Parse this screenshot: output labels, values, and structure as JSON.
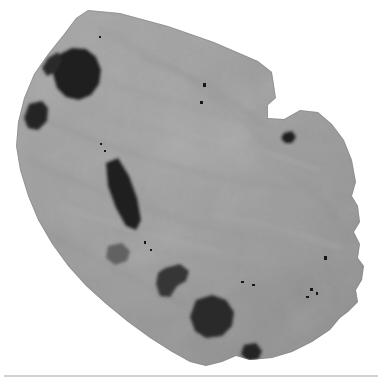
{
  "figure": {
    "alt_text": "Irregular polygonal grayscale scan of a sectioned specimen with dark void inclusions",
    "image_width": 382,
    "image_height": 383,
    "background_color": "#ffffff",
    "modality": "grayscale-scan"
  },
  "palette": {
    "background": "#ffffff",
    "matrix_light": "#b4b4b4",
    "matrix_mid": "#9a9a9a",
    "matrix_dark": "#7e7e7e",
    "void_black": "#141414",
    "void_dark": "#2c2c2c",
    "void_medium": "#4a4a4a",
    "speck_black": "#0d0d0d",
    "rule_gray": "#d2d2d2"
  },
  "specimen": {
    "outline_name": "specimen-boundary",
    "outline_points": "88,10 120,13 168,26 214,42 258,61 272,72 276,98 268,105 268,118 284,119 300,110 318,112 332,124 344,140 352,160 356,182 352,196 358,206 360,222 354,232 360,244 358,258 364,266 362,280 356,290 358,302 348,312 340,318 330,330 312,342 292,352 272,358 250,360 236,356 222,362 206,366 190,362 172,352 150,338 128,322 106,304 86,286 68,266 52,244 38,220 28,196 20,170 16,146 18,122 24,98 34,74 48,54 64,34 76,18",
    "fill": "#9a9a9a"
  },
  "voids": [
    {
      "name": "void-upper-left-large",
      "points": "60,54 72,48 86,49 96,57 101,70 99,84 91,95 79,100 66,97 57,88 53,74",
      "fill": "#161616"
    },
    {
      "name": "void-upper-left-tail",
      "points": "48,58 58,52 62,60 56,72 47,76 42,68",
      "fill": "#232323"
    },
    {
      "name": "void-left-small",
      "points": "29,104 42,101 48,108 47,121 38,130 28,128 24,118",
      "fill": "#1d1d1d"
    },
    {
      "name": "void-center-streak",
      "points": "106,163 118,158 129,176 137,198 141,220 136,230 126,226 116,208 108,186",
      "fill": "#161616"
    },
    {
      "name": "void-lower-center-hook",
      "points": "165,268 180,264 189,271 186,281 177,286 170,297 160,296 156,284 158,273",
      "fill": "#2e2e2e"
    },
    {
      "name": "void-bottom-large",
      "points": "196,300 212,295 226,300 234,312 232,326 222,336 206,338 195,331 190,317",
      "fill": "#222222"
    },
    {
      "name": "void-bottom-small",
      "points": "244,345 256,343 262,351 258,360 247,361 241,354",
      "fill": "#1e1e1e"
    },
    {
      "name": "void-right-dot",
      "points": "284,133 292,131 296,137 292,143 285,143 281,138",
      "fill": "#191919"
    },
    {
      "name": "void-faint-blob",
      "points": "108,246 122,243 130,251 127,261 115,265 106,258",
      "fill": "#5c5c5c"
    }
  ],
  "specks": [
    {
      "name": "speck-top-a",
      "x": 203,
      "y": 83,
      "w": 3,
      "h": 4
    },
    {
      "name": "speck-top-b",
      "x": 200,
      "y": 101,
      "w": 3,
      "h": 3
    },
    {
      "name": "speck-mid-right",
      "x": 324,
      "y": 256,
      "w": 3,
      "h": 4
    },
    {
      "name": "speck-right-cluster-a",
      "x": 310,
      "y": 288,
      "w": 3,
      "h": 3
    },
    {
      "name": "speck-right-cluster-b",
      "x": 316,
      "y": 292,
      "w": 2,
      "h": 3
    },
    {
      "name": "speck-right-cluster-c",
      "x": 306,
      "y": 296,
      "w": 3,
      "h": 2
    },
    {
      "name": "speck-center-low",
      "x": 144,
      "y": 241,
      "w": 2,
      "h": 3
    },
    {
      "name": "speck-center-low-b",
      "x": 150,
      "y": 249,
      "w": 2,
      "h": 2
    },
    {
      "name": "speck-lower-right",
      "x": 241,
      "y": 281,
      "w": 3,
      "h": 2
    },
    {
      "name": "speck-lower-right-b",
      "x": 252,
      "y": 284,
      "w": 3,
      "h": 2
    },
    {
      "name": "speck-upper-trail",
      "x": 100,
      "y": 143,
      "w": 2,
      "h": 2
    },
    {
      "name": "speck-upper-trail-b",
      "x": 104,
      "y": 150,
      "w": 2,
      "h": 2
    },
    {
      "name": "speck-top-edge",
      "x": 99,
      "y": 36,
      "w": 2,
      "h": 2
    }
  ],
  "texture_strokes": [
    {
      "name": "stroke-diag-1",
      "d": "M 40,118 L 120,150 L 210,176 L 300,190",
      "stroke": "#8d8d8d",
      "width": 1.6
    },
    {
      "name": "stroke-diag-2",
      "d": "M 30,160 L 110,196 L 200,226 L 290,244",
      "stroke": "#8d8d8d",
      "width": 1.4
    },
    {
      "name": "stroke-diag-3",
      "d": "M 60,66 L 150,96 L 240,120 L 330,140",
      "stroke": "#909090",
      "width": 1.2
    },
    {
      "name": "stroke-diag-4",
      "d": "M 100,30 L 170,64 L 230,110 L 276,152",
      "stroke": "#8a8a8a",
      "width": 1.2
    },
    {
      "name": "stroke-diag-5",
      "d": "M 150,324 L 230,300 L 300,270 L 352,238",
      "stroke": "#909090",
      "width": 1.3
    },
    {
      "name": "stroke-diag-6",
      "d": "M 90,282 L 170,262 L 250,236 L 330,208",
      "stroke": "#949494",
      "width": 1.1
    },
    {
      "name": "stroke-highlight-1",
      "d": "M 190,136 L 260,150 L 320,170",
      "stroke": "#b0b0b0",
      "width": 2
    },
    {
      "name": "stroke-highlight-2",
      "d": "M 60,206 L 140,232 L 220,252",
      "stroke": "#adadad",
      "width": 2
    },
    {
      "name": "stroke-highlight-3",
      "d": "M 210,214 L 280,228 L 340,248",
      "stroke": "#a8a8a8",
      "width": 2.4
    },
    {
      "name": "stroke-shadow-1",
      "d": "M 140,56 L 210,86 L 262,124",
      "stroke": "#878787",
      "width": 1.8
    },
    {
      "name": "stroke-shadow-2",
      "d": "M 46,232 L 120,272 L 190,308",
      "stroke": "#8b8b8b",
      "width": 1.6
    },
    {
      "name": "stroke-shadow-3",
      "d": "M 280,168 L 320,198 L 346,232",
      "stroke": "#8a8a8a",
      "width": 1.5
    },
    {
      "name": "stroke-fine-1",
      "d": "M 120,122 L 200,140 L 270,152",
      "stroke": "#969696",
      "width": 1
    },
    {
      "name": "stroke-fine-2",
      "d": "M 160,252 L 240,266 L 310,278",
      "stroke": "#8f8f8f",
      "width": 1
    }
  ],
  "rule": {
    "name": "bottom-divider",
    "color": "#d2d2d2",
    "x": 4,
    "y": 375,
    "width": 374,
    "height": 2
  }
}
